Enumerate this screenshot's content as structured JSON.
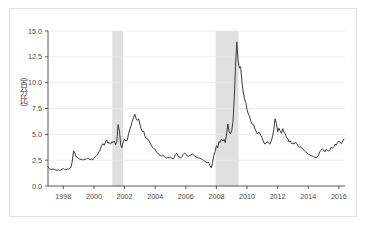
{
  "figure": {
    "background_color": "#ffffff",
    "border_color": "#e2e2e2",
    "line_color": "#3a3a3a",
    "grid_color": "#e8e8e8",
    "axis_color": "#5a5a5a",
    "shade_color": "#e0e0e0",
    "tick_label_color": "#4a4a4a"
  },
  "chart_data": {
    "type": "line",
    "title": "",
    "xlabel": "",
    "ylabel": "（百分比）",
    "xlim": [
      1997.0,
      2016.4
    ],
    "ylim": [
      0.0,
      15.0
    ],
    "grid": true,
    "legend": "none",
    "y_ticks": [
      "0.0",
      "2.5",
      "5.0",
      "7.5",
      "10.0",
      "12.5",
      "15.0"
    ],
    "y_tick_values": [
      0.0,
      2.5,
      5.0,
      7.5,
      10.0,
      12.5,
      15.0
    ],
    "x_ticks": [
      "1998",
      "2000",
      "2002",
      "2004",
      "2006",
      "2008",
      "2010",
      "2012",
      "2014",
      "2016"
    ],
    "x_tick_values": [
      1998,
      2000,
      2002,
      2004,
      2006,
      2008,
      2010,
      2012,
      2014,
      2016
    ],
    "shaded_regions": [
      {
        "label": "recession-2001",
        "x0": 2001.2,
        "x1": 2001.9
      },
      {
        "label": "recession-2008",
        "x0": 2007.95,
        "x1": 2009.45
      }
    ],
    "series": [
      {
        "name": "spread",
        "color": "#3a3a3a",
        "x": [
          1997.0,
          1997.08,
          1997.17,
          1997.25,
          1997.33,
          1997.42,
          1997.5,
          1997.58,
          1997.67,
          1997.75,
          1997.83,
          1997.92,
          1998.0,
          1998.08,
          1998.17,
          1998.25,
          1998.33,
          1998.42,
          1998.5,
          1998.58,
          1998.67,
          1998.75,
          1998.83,
          1998.92,
          1999.0,
          1999.08,
          1999.17,
          1999.25,
          1999.33,
          1999.42,
          1999.5,
          1999.58,
          1999.67,
          1999.75,
          1999.83,
          1999.92,
          2000.0,
          2000.08,
          2000.17,
          2000.25,
          2000.33,
          2000.42,
          2000.5,
          2000.58,
          2000.67,
          2000.75,
          2000.83,
          2000.92,
          2001.0,
          2001.08,
          2001.17,
          2001.25,
          2001.33,
          2001.42,
          2001.5,
          2001.58,
          2001.67,
          2001.75,
          2001.83,
          2001.92,
          2002.0,
          2002.08,
          2002.17,
          2002.25,
          2002.33,
          2002.42,
          2002.5,
          2002.58,
          2002.67,
          2002.75,
          2002.83,
          2002.92,
          2003.0,
          2003.08,
          2003.17,
          2003.25,
          2003.33,
          2003.42,
          2003.5,
          2003.58,
          2003.67,
          2003.75,
          2003.83,
          2003.92,
          2004.0,
          2004.08,
          2004.17,
          2004.25,
          2004.33,
          2004.42,
          2004.5,
          2004.58,
          2004.67,
          2004.75,
          2004.83,
          2004.92,
          2005.0,
          2005.08,
          2005.17,
          2005.25,
          2005.33,
          2005.42,
          2005.5,
          2005.58,
          2005.67,
          2005.75,
          2005.83,
          2005.92,
          2006.0,
          2006.08,
          2006.17,
          2006.25,
          2006.33,
          2006.42,
          2006.5,
          2006.58,
          2006.67,
          2006.75,
          2006.83,
          2006.92,
          2007.0,
          2007.08,
          2007.17,
          2007.25,
          2007.33,
          2007.42,
          2007.5,
          2007.58,
          2007.67,
          2007.75,
          2007.83,
          2007.92,
          2008.0,
          2008.08,
          2008.17,
          2008.25,
          2008.33,
          2008.42,
          2008.5,
          2008.58,
          2008.67,
          2008.75,
          2008.83,
          2008.92,
          2009.0,
          2009.08,
          2009.17,
          2009.25,
          2009.33,
          2009.42,
          2009.5,
          2009.58,
          2009.67,
          2009.75,
          2009.83,
          2009.92,
          2010.0,
          2010.08,
          2010.17,
          2010.25,
          2010.33,
          2010.42,
          2010.5,
          2010.58,
          2010.67,
          2010.75,
          2010.83,
          2010.92,
          2011.0,
          2011.08,
          2011.17,
          2011.25,
          2011.33,
          2011.42,
          2011.5,
          2011.58,
          2011.67,
          2011.75,
          2011.83,
          2011.92,
          2012.0,
          2012.08,
          2012.17,
          2012.25,
          2012.33,
          2012.42,
          2012.5,
          2012.58,
          2012.67,
          2012.75,
          2012.83,
          2012.92,
          2013.0,
          2013.08,
          2013.17,
          2013.25,
          2013.33,
          2013.42,
          2013.5,
          2013.58,
          2013.67,
          2013.75,
          2013.83,
          2013.92,
          2014.0,
          2014.08,
          2014.17,
          2014.25,
          2014.33,
          2014.42,
          2014.5,
          2014.58,
          2014.67,
          2014.75,
          2014.83,
          2014.92,
          2015.0,
          2015.08,
          2015.17,
          2015.25,
          2015.33,
          2015.42,
          2015.5,
          2015.58,
          2015.67,
          2015.75,
          2015.83,
          2015.92,
          2016.0,
          2016.08,
          2016.17,
          2016.25,
          2016.33
        ],
        "values": [
          1.85,
          1.7,
          1.62,
          1.58,
          1.65,
          1.6,
          1.55,
          1.52,
          1.58,
          1.5,
          1.55,
          1.62,
          1.7,
          1.6,
          1.58,
          1.65,
          1.62,
          1.72,
          1.8,
          2.35,
          3.4,
          3.2,
          2.85,
          2.75,
          2.7,
          2.55,
          2.6,
          2.52,
          2.55,
          2.62,
          2.58,
          2.7,
          2.62,
          2.55,
          2.6,
          2.52,
          2.7,
          2.8,
          2.95,
          3.1,
          3.3,
          3.55,
          3.9,
          4.1,
          3.95,
          4.25,
          4.45,
          4.15,
          4.2,
          4.05,
          4.3,
          4.2,
          4.35,
          4.0,
          4.35,
          5.95,
          5.3,
          3.95,
          3.7,
          4.3,
          4.55,
          4.35,
          4.4,
          4.95,
          5.4,
          5.8,
          6.25,
          6.6,
          6.95,
          6.55,
          6.35,
          6.5,
          6.0,
          5.55,
          5.25,
          5.3,
          4.85,
          4.6,
          4.55,
          4.4,
          4.15,
          3.95,
          3.75,
          3.6,
          3.55,
          3.3,
          3.2,
          3.05,
          2.95,
          2.9,
          3.0,
          2.85,
          2.75,
          2.7,
          2.8,
          2.72,
          2.8,
          2.68,
          2.62,
          2.78,
          3.05,
          3.15,
          2.9,
          2.78,
          2.7,
          2.85,
          3.05,
          3.2,
          3.05,
          2.95,
          2.85,
          2.95,
          3.0,
          3.1,
          3.0,
          2.9,
          2.82,
          2.75,
          2.72,
          2.7,
          2.65,
          2.55,
          2.48,
          2.4,
          2.3,
          2.25,
          2.3,
          1.95,
          1.75,
          2.3,
          2.95,
          3.35,
          3.9,
          3.7,
          4.3,
          4.2,
          4.55,
          4.35,
          4.5,
          4.2,
          5.1,
          6.0,
          5.25,
          5.05,
          5.35,
          6.2,
          8.6,
          11.6,
          13.95,
          12.1,
          11.4,
          11.55,
          10.05,
          9.1,
          8.5,
          8.05,
          7.4,
          7.0,
          6.7,
          6.25,
          6.0,
          5.95,
          5.6,
          5.35,
          5.05,
          5.2,
          5.15,
          4.85,
          4.6,
          4.25,
          4.05,
          4.15,
          4.3,
          4.15,
          4.05,
          4.35,
          4.8,
          5.45,
          6.5,
          6.05,
          5.25,
          5.6,
          5.3,
          5.1,
          5.55,
          5.2,
          5.05,
          4.7,
          4.55,
          4.25,
          4.35,
          4.1,
          4.15,
          4.05,
          4.25,
          4.1,
          3.9,
          3.75,
          3.8,
          3.65,
          3.55,
          3.4,
          3.3,
          3.2,
          3.1,
          3.05,
          2.95,
          2.9,
          2.85,
          2.8,
          2.75,
          2.8,
          3.0,
          3.3,
          3.45,
          3.6,
          3.5,
          3.3,
          3.55,
          3.45,
          3.4,
          3.5,
          3.75,
          3.65,
          3.8,
          4.05,
          3.95,
          4.2,
          4.35,
          4.2,
          4.1,
          4.35,
          4.55
        ]
      }
    ]
  }
}
